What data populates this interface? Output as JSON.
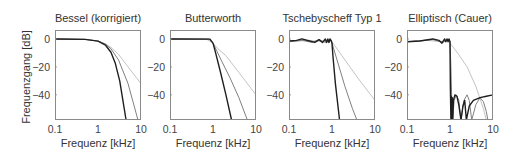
{
  "figure": {
    "ylabel": "Frequenzgang [dB]",
    "colors": {
      "order_high": "#1f1f1f",
      "order_mid": "#808080",
      "order_low": "#c4c4c4",
      "frame": "#8a8a8a",
      "text": "#444444"
    }
  },
  "chart_data": [
    {
      "type": "line",
      "title": "Bessel (korrigiert)",
      "xlabel": "Frequenz [kHz]",
      "ylabel": "Frequenzgang [dB]",
      "xscale": "log",
      "xlim": [
        0.1,
        10
      ],
      "ylim": [
        -58,
        6.4
      ],
      "xticks": [
        0.1,
        1,
        10
      ],
      "xticklabels": [
        "0.1",
        "1",
        "10"
      ],
      "yticks": [
        0,
        -20,
        -40
      ],
      "yticklabels": [
        "0",
        "-20",
        "-40"
      ],
      "grid": false,
      "show_ylabel": true,
      "series": [
        {
          "name": "order low",
          "x": [
            0.1,
            0.5,
            1,
            1.5,
            2,
            3,
            5,
            10
          ],
          "y": [
            0,
            -0.3,
            -1.5,
            -3.5,
            -6,
            -11,
            -20,
            -32
          ]
        },
        {
          "name": "order mid",
          "x": [
            0.1,
            0.5,
            1,
            1.5,
            2,
            3,
            5,
            8.5
          ],
          "y": [
            0,
            -0.3,
            -1.5,
            -3.8,
            -7,
            -15,
            -32,
            -58
          ]
        },
        {
          "name": "order high",
          "x": [
            0.1,
            0.5,
            1,
            1.5,
            2,
            2.5,
            3.2,
            4.5
          ],
          "y": [
            0,
            -0.3,
            -1.6,
            -4.5,
            -9.5,
            -17,
            -30,
            -58
          ]
        }
      ]
    },
    {
      "type": "line",
      "title": "Butterworth",
      "xlabel": "Frequenz [kHz]",
      "ylabel": "",
      "xscale": "log",
      "xlim": [
        0.1,
        10
      ],
      "ylim": [
        -58,
        6.4
      ],
      "xticks": [
        0.1,
        1,
        10
      ],
      "xticklabels": [
        "0.1",
        "1",
        "10"
      ],
      "yticks": [
        0,
        -20,
        -40
      ],
      "yticklabels": [
        "0",
        "-20",
        "-40"
      ],
      "grid": false,
      "show_ylabel": false,
      "series": [
        {
          "name": "order low",
          "x": [
            0.1,
            0.7,
            1,
            1.3,
            2,
            4,
            10
          ],
          "y": [
            0,
            -0.1,
            -3,
            -7,
            -12,
            -24,
            -40
          ]
        },
        {
          "name": "order mid",
          "x": [
            0.1,
            0.8,
            1,
            1.2,
            1.6,
            2.5,
            4,
            6.3
          ],
          "y": [
            0,
            -0.1,
            -3,
            -8,
            -16,
            -28,
            -42,
            -58
          ]
        },
        {
          "name": "order high",
          "x": [
            0.1,
            0.85,
            1,
            1.15,
            1.5,
            2,
            2.7
          ],
          "y": [
            0,
            -0.1,
            -3,
            -10,
            -24,
            -40,
            -58
          ]
        }
      ]
    },
    {
      "type": "line",
      "title": "Tschebyscheff Typ 1",
      "xlabel": "Frequenz [kHz]",
      "ylabel": "",
      "xscale": "log",
      "xlim": [
        0.1,
        10
      ],
      "ylim": [
        -58,
        6.4
      ],
      "xticks": [
        0.1,
        1,
        10
      ],
      "xticklabels": [
        "0.1",
        "1",
        "10"
      ],
      "yticks": [
        0,
        -20,
        -40
      ],
      "yticklabels": [
        "0",
        "-20",
        "-40"
      ],
      "grid": false,
      "show_ylabel": false,
      "series": [
        {
          "name": "order low",
          "x": [
            0.1,
            0.3,
            0.6,
            0.9,
            1,
            2,
            4,
            10
          ],
          "y": [
            -2,
            -1,
            -2,
            -0.5,
            -2,
            -15,
            -28,
            -44
          ]
        },
        {
          "name": "order mid",
          "x": [
            0.1,
            0.2,
            0.35,
            0.5,
            0.7,
            0.9,
            1,
            1.4,
            2,
            3,
            3.8
          ],
          "y": [
            -2,
            -1,
            -2.5,
            -0.5,
            -2.5,
            -0.5,
            -3,
            -18,
            -34,
            -50,
            -58
          ]
        },
        {
          "name": "order high",
          "x": [
            0.1,
            0.15,
            0.2,
            0.3,
            0.4,
            0.5,
            0.6,
            0.7,
            0.75,
            0.8,
            0.85,
            0.9,
            0.95,
            1,
            1.05,
            1.2,
            1.5
          ],
          "y": [
            -1.5,
            -1,
            0,
            -1.5,
            -2.5,
            -0.5,
            -2.5,
            0,
            -2.5,
            0,
            -2.5,
            0,
            -1,
            -3,
            -12,
            -32,
            -58
          ]
        }
      ]
    },
    {
      "type": "line",
      "title": "Elliptisch (Cauer)",
      "xlabel": "Frequenz [kHz]",
      "ylabel": "",
      "xscale": "log",
      "xlim": [
        0.1,
        10
      ],
      "ylim": [
        -58,
        6.4
      ],
      "xticks": [
        0.1,
        1,
        10
      ],
      "xticklabels": [
        "0.1",
        "1",
        "10"
      ],
      "yticks": [
        0,
        -20,
        -40
      ],
      "yticklabels": [
        "0",
        "-20",
        "-40"
      ],
      "grid": false,
      "show_ylabel": false,
      "series": [
        {
          "name": "order low",
          "x": [
            0.1,
            0.3,
            0.6,
            0.9,
            1,
            1.5,
            2.5,
            4,
            6,
            7
          ],
          "y": [
            -2,
            -1,
            -2,
            -0.5,
            -3,
            -10,
            -20,
            -34,
            -50,
            -58
          ]
        },
        {
          "name": "order mid",
          "x": [
            0.1,
            0.4,
            0.7,
            0.9,
            1,
            1.05,
            1.1,
            1.15,
            1.25,
            1.4,
            1.6,
            1.8,
            2.1,
            2.5,
            2.8,
            3.2,
            4,
            5,
            6,
            7,
            7.6
          ],
          "y": [
            -2,
            -0.5,
            -2.5,
            0,
            -2,
            -20,
            -45,
            -58,
            -44,
            -40,
            -44,
            -58,
            -44,
            -40,
            -44,
            -58,
            -47,
            -42,
            -45,
            -52,
            -58
          ]
        },
        {
          "name": "order high",
          "x": [
            0.1,
            0.2,
            0.4,
            0.55,
            0.65,
            0.75,
            0.8,
            0.85,
            0.9,
            0.95,
            1,
            1.02,
            1.05,
            1.07,
            1.1,
            1.13,
            1.16,
            1.2,
            1.3,
            1.45,
            1.6,
            1.8,
            2.0,
            2.2,
            2.4,
            2.8,
            3.5,
            5,
            7,
            10
          ],
          "y": [
            -2,
            -1.5,
            0,
            -1,
            -3,
            0,
            -2,
            0,
            -2,
            0,
            -2,
            -35,
            -58,
            -41,
            -58,
            -42,
            -58,
            -44,
            -40,
            -41,
            -47,
            -58,
            -48,
            -44,
            -58,
            -48,
            -44,
            -42,
            -41,
            -40
          ]
        }
      ]
    }
  ]
}
